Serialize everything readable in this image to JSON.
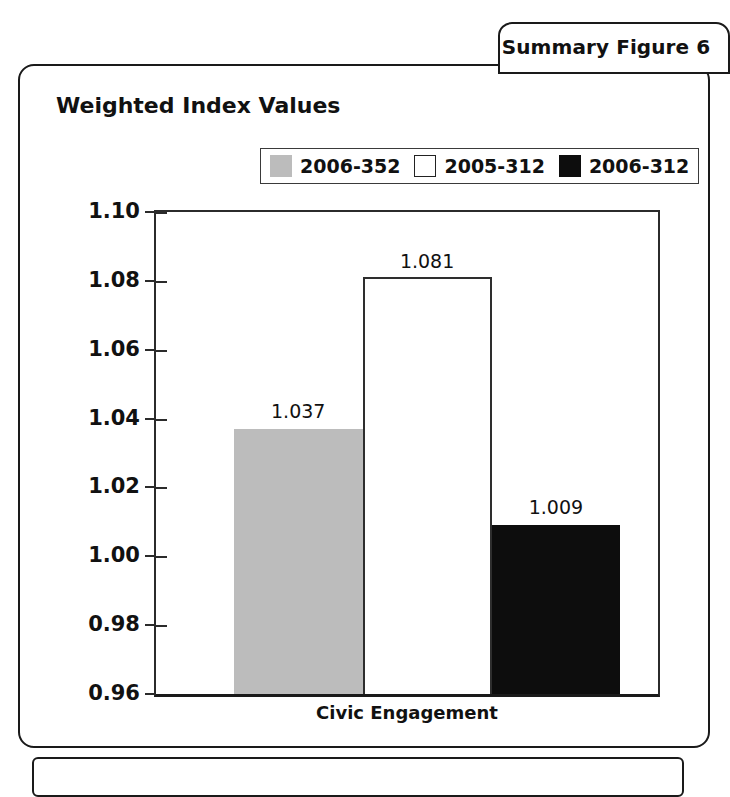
{
  "tab": {
    "label": "Summary Figure 6"
  },
  "chart_data": {
    "type": "bar",
    "title": "Weighted Index Values",
    "xlabel": "",
    "ylabel": "",
    "categories": [
      "Civic Engagement"
    ],
    "series": [
      {
        "name": "2006-352",
        "color": "#bcbcbc",
        "values": [
          1.037
        ],
        "value_labels": [
          "1.037"
        ]
      },
      {
        "name": "2005-312",
        "color": "#ffffff",
        "values": [
          1.081
        ],
        "value_labels": [
          "1.081"
        ]
      },
      {
        "name": "2006-312",
        "color": "#0d0d0d",
        "values": [
          1.009
        ],
        "value_labels": [
          "1.009"
        ]
      }
    ],
    "ylim": [
      0.96,
      1.1
    ],
    "ytick_labels": [
      "1.10",
      "1.08",
      "1.06",
      "1.04",
      "1.02",
      "1.00",
      "0.98",
      "0.96"
    ],
    "ytick_values": [
      1.1,
      1.08,
      1.06,
      1.04,
      1.02,
      1.0,
      0.98,
      0.96
    ],
    "grid": false,
    "legend_position": "top-center"
  },
  "legend": {
    "items": [
      {
        "label": "2006-352",
        "swatch": "gray"
      },
      {
        "label": "2005-312",
        "swatch": "white"
      },
      {
        "label": "2006-312",
        "swatch": "black"
      }
    ]
  }
}
